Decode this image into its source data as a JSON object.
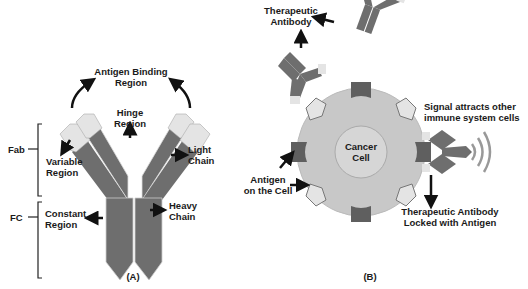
{
  "panel_a": {
    "caption": "(A)",
    "labels": {
      "antigen_binding_1": "Antigen Binding",
      "antigen_binding_2": "Region",
      "hinge_1": "Hinge",
      "hinge_2": "Region",
      "light_chain_1": "Light",
      "light_chain_2": "Chain",
      "variable_1": "Variable",
      "variable_2": "Region",
      "constant_1": "Constant",
      "constant_2": "Region",
      "heavy_chain_1": "Heavy",
      "heavy_chain_2": "Chain",
      "fab": "Fab",
      "fc": "FC"
    }
  },
  "panel_b": {
    "caption": "(B)",
    "labels": {
      "therapeutic_1": "Therapeutic",
      "therapeutic_2": "Antibody",
      "cancer_1": "Cancer",
      "cancer_2": "Cell",
      "signal_1": "Signal attracts other",
      "signal_2": "immune system cells",
      "antigen_cell_1": "Antigen",
      "antigen_cell_2": "on the Cell",
      "locked_1": "Therapeutic Antibody",
      "locked_2": "Locked with Antigen"
    }
  },
  "colors": {
    "heavy_chain": "#6e6e6e",
    "light_tip": "#e4e4e4",
    "cell_outer": "#c8c8c8",
    "cell_inner": "#d6d6d6",
    "receptor": "#5f5f5f",
    "text": "#1a1a1a"
  }
}
